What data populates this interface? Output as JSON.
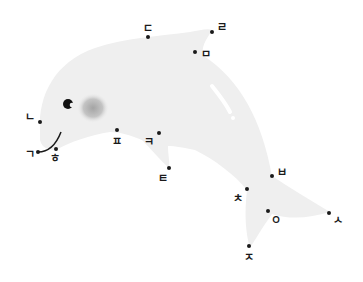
{
  "puzzle": {
    "type": "connect-the-dots",
    "subject": "dolphin",
    "body_color": "#efefef",
    "dot_color": "#1a1a1a",
    "cheek_color": "#a9a9a9",
    "points": [
      {
        "label": "ㄱ",
        "dot": [
          38,
          152
        ],
        "text": [
          30,
          154
        ]
      },
      {
        "label": "ㄴ",
        "dot": [
          40,
          122
        ],
        "text": [
          30,
          117
        ]
      },
      {
        "label": "ㄷ",
        "dot": [
          148,
          37
        ],
        "text": [
          148,
          28
        ]
      },
      {
        "label": "ㄹ",
        "dot": [
          212,
          32
        ],
        "text": [
          222,
          27
        ]
      },
      {
        "label": "ㅁ",
        "dot": [
          195,
          52
        ],
        "text": [
          206,
          54
        ]
      },
      {
        "label": "ㅂ",
        "dot": [
          272,
          176
        ],
        "text": [
          282,
          172
        ]
      },
      {
        "label": "ㅅ",
        "dot": [
          329,
          213
        ],
        "text": [
          338,
          220
        ]
      },
      {
        "label": "ㅇ",
        "dot": [
          268,
          211
        ],
        "text": [
          276,
          220
        ]
      },
      {
        "label": "ㅈ",
        "dot": [
          249,
          246
        ],
        "text": [
          249,
          257
        ]
      },
      {
        "label": "ㅊ",
        "dot": [
          247,
          189
        ],
        "text": [
          238,
          198
        ]
      },
      {
        "label": "ㅌ",
        "dot": [
          169,
          168
        ],
        "text": [
          163,
          178
        ]
      },
      {
        "label": "ㅋ",
        "dot": [
          159,
          133
        ],
        "text": [
          149,
          142
        ]
      },
      {
        "label": "ㅍ",
        "dot": [
          117,
          130
        ],
        "text": [
          117,
          141
        ]
      },
      {
        "label": "ㅎ",
        "dot": [
          56,
          149
        ],
        "text": [
          55,
          158
        ]
      }
    ]
  }
}
